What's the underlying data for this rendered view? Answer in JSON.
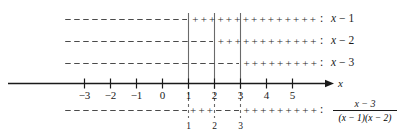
{
  "figure": {
    "type": "sign-chart",
    "background_color": "#ffffff",
    "ink_color": "#1a1a1a",
    "dashed_color": "#555555",
    "guide_color": "#666666"
  },
  "axis": {
    "name": "x",
    "x_min": -3.8,
    "x_max": 6.2,
    "tick_values": [
      -3,
      -2,
      -1,
      0,
      1,
      2,
      3,
      4,
      5
    ],
    "tick_labels": [
      "−3",
      "−2",
      "−1",
      "0",
      "1",
      "2",
      "3",
      "4",
      "5"
    ],
    "arrow": "right"
  },
  "critical_points": {
    "values": [
      1,
      2,
      3
    ],
    "labels": [
      "1",
      "2",
      "3"
    ]
  },
  "rows": [
    {
      "id": "row-x-minus-1",
      "colon": ":",
      "label": "x − 1",
      "label_var": "x",
      "label_rest": "− 1",
      "segments": [
        {
          "from": -3.8,
          "to": 1,
          "sign": "minus"
        },
        {
          "from": 1,
          "to": 6.05,
          "sign": "plus"
        }
      ]
    },
    {
      "id": "row-x-minus-2",
      "colon": ":",
      "label": "x − 2",
      "label_var": "x",
      "label_rest": "− 2",
      "segments": [
        {
          "from": -3.8,
          "to": 2,
          "sign": "minus"
        },
        {
          "from": 2,
          "to": 6.05,
          "sign": "plus"
        }
      ]
    },
    {
      "id": "row-x-minus-3",
      "colon": ":",
      "label": "x − 3",
      "label_var": "x",
      "label_rest": "− 3",
      "segments": [
        {
          "from": -3.8,
          "to": 3,
          "sign": "minus"
        },
        {
          "from": 3,
          "to": 6.05,
          "sign": "plus"
        }
      ]
    }
  ],
  "quotient_row": {
    "id": "row-quotient",
    "colon": ":",
    "numerator": "x − 3",
    "denominator": "(x − 1)(x − 2)",
    "segments": [
      {
        "from": -3.8,
        "to": 1,
        "sign": "minus"
      },
      {
        "from": 1,
        "to": 2,
        "sign": "plus"
      },
      {
        "from": 2,
        "to": 3,
        "sign": "minus"
      },
      {
        "from": 3,
        "to": 6.05,
        "sign": "plus"
      }
    ]
  },
  "chart_data": {
    "type": "table",
    "xlabel": "x",
    "xlim": [
      -3.8,
      6.2
    ],
    "grid": false,
    "critical_points": [
      1,
      2,
      3
    ],
    "series": [
      {
        "name": "x - 1",
        "intervals": [
          {
            "interval": "(-inf, 1)",
            "sign": "-"
          },
          {
            "interval": "(1, inf)",
            "sign": "+"
          }
        ]
      },
      {
        "name": "x - 2",
        "intervals": [
          {
            "interval": "(-inf, 2)",
            "sign": "-"
          },
          {
            "interval": "(2, inf)",
            "sign": "+"
          }
        ]
      },
      {
        "name": "x - 3",
        "intervals": [
          {
            "interval": "(-inf, 3)",
            "sign": "-"
          },
          {
            "interval": "(3, inf)",
            "sign": "+"
          }
        ]
      },
      {
        "name": "(x - 3)/((x - 1)(x - 2))",
        "intervals": [
          {
            "interval": "(-inf, 1)",
            "sign": "-"
          },
          {
            "interval": "(1, 2)",
            "sign": "+"
          },
          {
            "interval": "(2, 3)",
            "sign": "-"
          },
          {
            "interval": "(3, inf)",
            "sign": "+"
          }
        ]
      }
    ]
  }
}
